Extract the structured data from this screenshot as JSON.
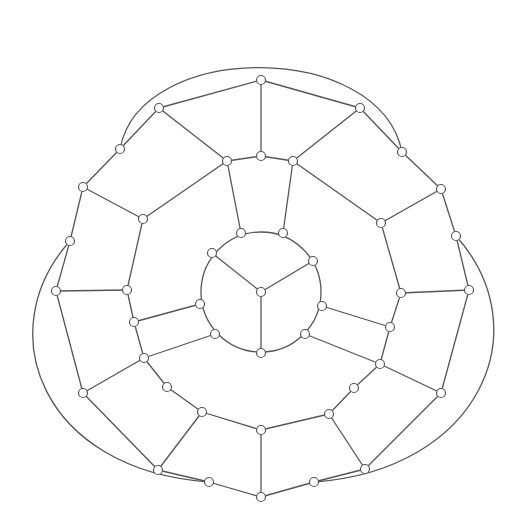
{
  "diagram": {
    "type": "planar-graph",
    "colors": {
      "stroke": "#555555",
      "node_fill": "#ffffff",
      "background": "#ffffff"
    },
    "node_radius": 4.5,
    "inner_circle": {
      "cx": 261,
      "cy": 292,
      "r": 60
    },
    "nodes": {
      "c": [
        261,
        292
      ],
      "i1": [
        241,
        233
      ],
      "i2": [
        283,
        233
      ],
      "i3": [
        212,
        253
      ],
      "i4": [
        313,
        261
      ],
      "i5": [
        200,
        304
      ],
      "i6": [
        322,
        306
      ],
      "i7": [
        215,
        334
      ],
      "i8": [
        305,
        334
      ],
      "i9": [
        261,
        353
      ],
      "m1": [
        227,
        161
      ],
      "m2": [
        261,
        156
      ],
      "m3": [
        293,
        161
      ],
      "m4": [
        143,
        219
      ],
      "m5": [
        381,
        223
      ],
      "m6": [
        127,
        290
      ],
      "m7": [
        401,
        293
      ],
      "m8": [
        134,
        322
      ],
      "m9": [
        390,
        327
      ],
      "m10": [
        144,
        358
      ],
      "m11": [
        380,
        364
      ],
      "m12": [
        167,
        387
      ],
      "m13": [
        354,
        388
      ],
      "m14": [
        202,
        412
      ],
      "m15": [
        329,
        414
      ],
      "m16": [
        261,
        430
      ],
      "o1": [
        261,
        80
      ],
      "o2": [
        159,
        108
      ],
      "o3": [
        360,
        108
      ],
      "o4": [
        120,
        149
      ],
      "o5": [
        402,
        152
      ],
      "o6": [
        83,
        187
      ],
      "o7": [
        441,
        189
      ],
      "o8": [
        70,
        241
      ],
      "o9": [
        456,
        236
      ],
      "o10": [
        56,
        291
      ],
      "o11": [
        469,
        290
      ],
      "o12": [
        83,
        393
      ],
      "o13": [
        441,
        393
      ],
      "o14": [
        158,
        470
      ],
      "o15": [
        365,
        469
      ],
      "o16": [
        209,
        482
      ],
      "o17": [
        314,
        482
      ],
      "o18": [
        261,
        497
      ]
    },
    "edges": [
      [
        "c",
        "i3"
      ],
      [
        "c",
        "i4"
      ],
      [
        "c",
        "i9"
      ],
      [
        "i1",
        "m1"
      ],
      [
        "i2",
        "m3"
      ],
      [
        "i5",
        "m8"
      ],
      [
        "i7",
        "m10"
      ],
      [
        "i6",
        "m9"
      ],
      [
        "i8",
        "m11"
      ],
      [
        "m1",
        "m2"
      ],
      [
        "m2",
        "m3"
      ],
      [
        "m2",
        "o1"
      ],
      [
        "m1",
        "m4"
      ],
      [
        "m3",
        "m5"
      ],
      [
        "m4",
        "m6"
      ],
      [
        "m6",
        "m8"
      ],
      [
        "m8",
        "m10"
      ],
      [
        "m10",
        "m12"
      ],
      [
        "m5",
        "m7"
      ],
      [
        "m7",
        "m9"
      ],
      [
        "m9",
        "m11"
      ],
      [
        "m11",
        "m13"
      ],
      [
        "m12",
        "m14"
      ],
      [
        "m14",
        "m16"
      ],
      [
        "m16",
        "m15"
      ],
      [
        "m15",
        "m13"
      ],
      [
        "m16",
        "o18"
      ],
      [
        "o1",
        "o2"
      ],
      [
        "o1",
        "o3"
      ],
      [
        "o2",
        "m1"
      ],
      [
        "o3",
        "m3"
      ],
      [
        "o2",
        "o4"
      ],
      [
        "o4",
        "o6"
      ],
      [
        "o3",
        "o5"
      ],
      [
        "o5",
        "o7"
      ],
      [
        "o6",
        "m4"
      ],
      [
        "o7",
        "m5"
      ],
      [
        "o6",
        "o8"
      ],
      [
        "o8",
        "o10"
      ],
      [
        "o7",
        "o9"
      ],
      [
        "o9",
        "o11"
      ],
      [
        "o10",
        "m6"
      ],
      [
        "o11",
        "m7"
      ],
      [
        "o10",
        "o12"
      ],
      [
        "o11",
        "o13"
      ],
      [
        "o12",
        "m10"
      ],
      [
        "o13",
        "m11"
      ],
      [
        "o12",
        "o14"
      ],
      [
        "o13",
        "o15"
      ],
      [
        "o14",
        "m14"
      ],
      [
        "o15",
        "m15"
      ],
      [
        "o14",
        "o16"
      ],
      [
        "o16",
        "o18"
      ],
      [
        "o15",
        "o17"
      ],
      [
        "o17",
        "o18"
      ]
    ],
    "arcs": [
      {
        "from": "o4",
        "to": "o5",
        "path": "M120,149 C140,40 380,40 402,152"
      },
      {
        "from": "o8",
        "to": "o16",
        "path": "M70,241 C-10,330 40,470 209,482"
      },
      {
        "from": "o9",
        "to": "o17",
        "path": "M456,236 C540,330 480,470 314,482"
      }
    ]
  }
}
